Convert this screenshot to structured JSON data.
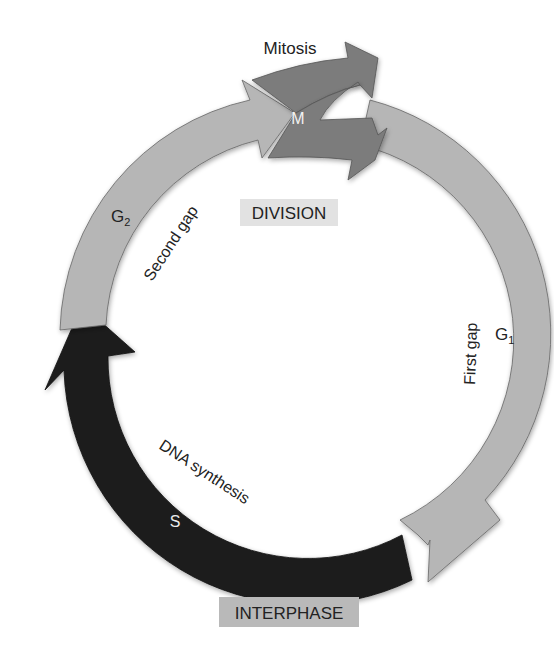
{
  "labels": {
    "mitosis": "Mitosis",
    "m": "M",
    "division": "DIVISION",
    "g2": "G",
    "g2_sub": "2",
    "second_gap": "Second gap",
    "g1": "G",
    "g1_sub": "1",
    "first_gap": "First gap",
    "dna_synthesis": "DNA synthesis",
    "s": "S",
    "interphase": "INTERPHASE"
  },
  "phases": [
    {
      "id": "M",
      "name": "Mitosis",
      "color": "#7a7a7a"
    },
    {
      "id": "G1",
      "name": "First gap",
      "color": "#b4b4b4"
    },
    {
      "id": "S",
      "name": "DNA synthesis",
      "color": "#1c1c1c"
    },
    {
      "id": "G2",
      "name": "Second gap",
      "color": "#b4b4b4"
    }
  ],
  "colors": {
    "light_arc": "#b6b6b6",
    "mitosis_arc": "#7b7b7b",
    "s_arc": "#1e1e1e",
    "division_box": "#e2e2e2",
    "interphase_box": "#b9b9b9"
  }
}
